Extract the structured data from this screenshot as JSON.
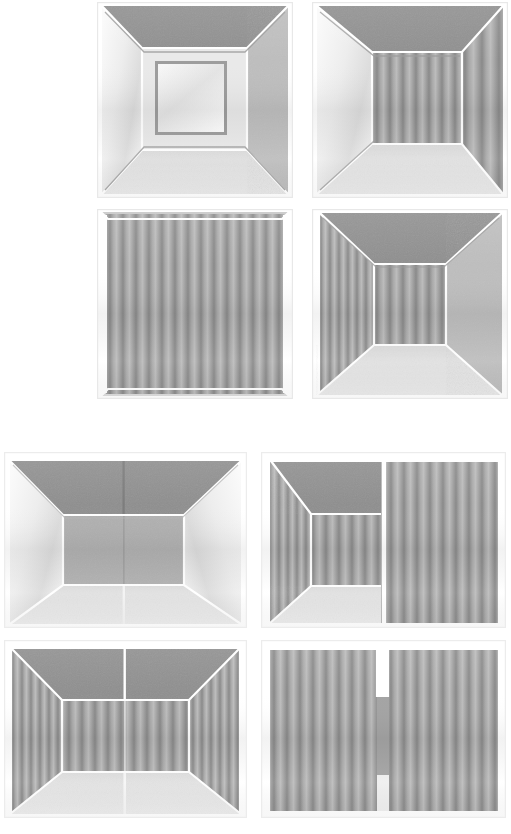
{
  "figure": {
    "background_color": "#ffffff",
    "canvas": {
      "width": 511,
      "height": 834
    },
    "palette": {
      "ceiling_gray": "#8e8e8e",
      "wall_light_gray": "#bdbdbd",
      "wall_bright": "#f2f2f2",
      "floor_light": "#e2e2e2",
      "edge_white": "#ffffff",
      "edge_shadow": "#9a9a9a",
      "stripe_dark": "#8a8a8a",
      "stripe_light": "#b5b5b5"
    },
    "groups": [
      {
        "name": "top-group",
        "layout": "2x2",
        "panel_shape": "square",
        "panels": [
          {
            "id": "panel-1",
            "label": "one-point perspective box with inset back opening",
            "view": "corner-box",
            "ceiling": "plain-gray",
            "left_wall": "bright-gradient",
            "right_wall": "light-gray",
            "back_wall": "bright-gradient-inset-frame",
            "floor": "light",
            "texture": "none"
          },
          {
            "id": "panel-2",
            "label": "one-point perspective box, striped right and back walls",
            "view": "corner-box",
            "ceiling": "plain-gray",
            "left_wall": "bright-gradient",
            "right_wall": "vertical-stripes",
            "back_wall": "vertical-stripes",
            "floor": "light",
            "texture": "vertical-stripes"
          },
          {
            "id": "panel-3",
            "label": "flat frontal striped wall filling frame",
            "view": "flat-wall",
            "ceiling": "none",
            "left_wall": "none",
            "right_wall": "none",
            "back_wall": "vertical-stripes",
            "floor": "none",
            "texture": "vertical-stripes"
          },
          {
            "id": "panel-4",
            "label": "one-point perspective box, striped left and back walls",
            "view": "corner-box",
            "ceiling": "plain-gray",
            "left_wall": "vertical-stripes",
            "right_wall": "light-gray",
            "back_wall": "vertical-stripes",
            "floor": "light",
            "texture": "vertical-stripes"
          }
        ]
      },
      {
        "name": "bottom-group",
        "layout": "2x2",
        "panel_shape": "wide",
        "panels": [
          {
            "id": "panel-5",
            "label": "wide room, plain walls, vertical seam in back wall",
            "view": "wide-box",
            "ceiling": "plain-gray",
            "left_wall": "bright-gradient",
            "right_wall": "bright-gradient",
            "back_wall": "plain-gray-seam",
            "floor": "light",
            "texture": "none",
            "seam": "center-vertical"
          },
          {
            "id": "panel-6",
            "label": "left half room view joined to right half flat striped wall",
            "view": "split-composite",
            "ceiling": "plain-gray",
            "left_wall": "vertical-stripes",
            "right_wall": "vertical-stripes-flat",
            "back_wall": "vertical-stripes",
            "floor": "light",
            "texture": "vertical-stripes",
            "seam": "center-vertical"
          },
          {
            "id": "panel-7",
            "label": "wide room, mirrored striped halves, seam at center",
            "view": "wide-box",
            "ceiling": "plain-gray",
            "left_wall": "vertical-stripes",
            "right_wall": "vertical-stripes",
            "back_wall": "vertical-stripes",
            "floor": "light",
            "texture": "vertical-stripes",
            "seam": "center-vertical"
          },
          {
            "id": "panel-8",
            "label": "two flat striped walls meeting at a narrow center column",
            "view": "split-flat",
            "ceiling": "none",
            "left_wall": "vertical-stripes-flat",
            "right_wall": "vertical-stripes-flat",
            "back_wall": "none",
            "floor": "none",
            "texture": "vertical-stripes",
            "seam": "center-column"
          }
        ]
      }
    ]
  }
}
